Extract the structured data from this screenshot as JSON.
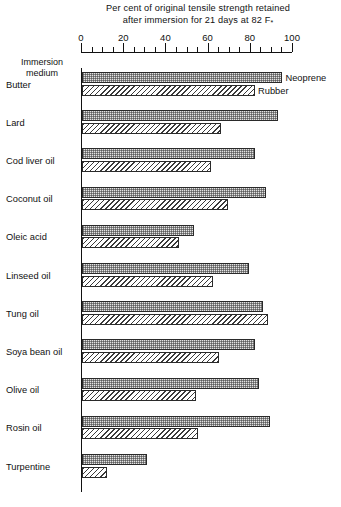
{
  "chart_data": {
    "type": "bar",
    "orientation": "horizontal",
    "title": "Per cent of original tensile strength retained after immersion for 21 days at 82 F",
    "title_lines": [
      "Per cent of original tensile strength retained",
      "after immersion for 21 days at 82 F"
    ],
    "title_superscript": "*",
    "xlabel": "",
    "ylabel": "Immersion medium",
    "axis_caption_lines": [
      "Immersion",
      "medium"
    ],
    "xlim": [
      0,
      100
    ],
    "xticks": [
      0,
      20,
      40,
      60,
      80,
      100
    ],
    "xtick_labels": [
      "0",
      "20",
      "40",
      "60",
      "80",
      "100"
    ],
    "minor_tick_step": 5,
    "grid": false,
    "legend_position": "inline-right-of-first-pair",
    "categories": [
      "Butter",
      "Lard",
      "Cod liver oil",
      "Coconut oil",
      "Oleic acid",
      "Linseed oil",
      "Tung oil",
      "Soya bean oil",
      "Olive oil",
      "Rosin oil",
      "Turpentine"
    ],
    "series": [
      {
        "name": "Neoprene",
        "pattern": "stipple",
        "color": "#e3e3e3",
        "values": [
          95,
          93,
          82,
          87,
          53,
          79,
          86,
          82,
          84,
          89,
          31
        ]
      },
      {
        "name": "Rubber",
        "pattern": "diagonal-hatch",
        "color": "#f2f2f2",
        "values": [
          82,
          66,
          61,
          69,
          46,
          62,
          88,
          65,
          54,
          55,
          12
        ]
      }
    ]
  },
  "legend": {
    "neoprene": "Neoprene",
    "rubber": "Rubber"
  }
}
